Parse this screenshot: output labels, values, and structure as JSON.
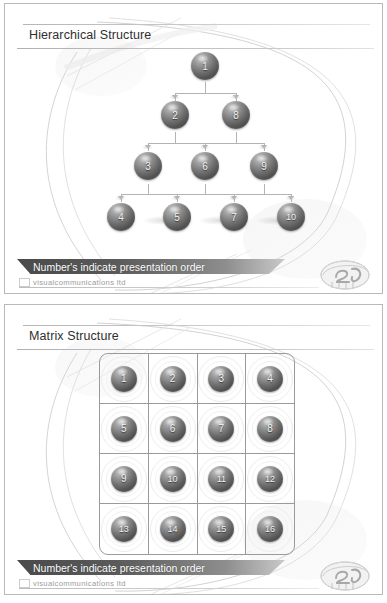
{
  "deck": {
    "brand": "visualcommunications ltd",
    "footer_note": "Number's indicate presentation order",
    "logo_name": "v2-pebble-logo"
  },
  "slides": [
    {
      "id": "hierarchical",
      "title": "Hierarchical Structure",
      "footer_note": "Number's indicate presentation order",
      "brand": "visualcommunications ltd",
      "chart_type": "diagram-tree",
      "levels": [
        {
          "level": 1,
          "nodes": [
            "1"
          ]
        },
        {
          "level": 2,
          "nodes": [
            "2",
            "8"
          ]
        },
        {
          "level": 3,
          "nodes": [
            "3",
            "6",
            "9"
          ]
        },
        {
          "level": 4,
          "nodes": [
            "4",
            "5",
            "7",
            "10"
          ]
        }
      ],
      "nodes": [
        "1",
        "2",
        "8",
        "3",
        "6",
        "9",
        "4",
        "5",
        "7",
        "10"
      ]
    },
    {
      "id": "matrix",
      "title": "Matrix Structure",
      "footer_note": "Number's indicate presentation order",
      "brand": "visualcommunications ltd",
      "chart_type": "diagram-grid",
      "grid": {
        "rows": 4,
        "cols": 4
      },
      "cells": [
        [
          "1",
          "2",
          "3",
          "4"
        ],
        [
          "5",
          "6",
          "7",
          "8"
        ],
        [
          "9",
          "10",
          "11",
          "12"
        ],
        [
          "13",
          "14",
          "15",
          "16"
        ]
      ]
    }
  ],
  "colors": {
    "sphere_dark": "#4e4e4e",
    "sphere_light": "#c6c6c6",
    "banner_dark": "#4a4a4a",
    "banner_light": "#c9c9c9",
    "rule": "#b9b9b9",
    "title_text": "#2f2f2f",
    "brand_text": "#9b9b9b"
  }
}
